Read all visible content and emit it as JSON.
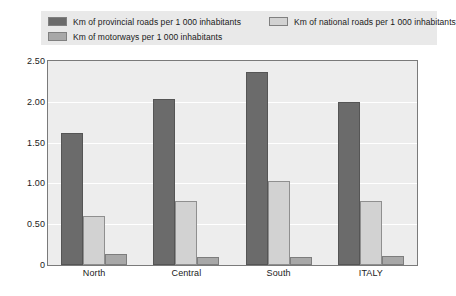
{
  "chart_data": {
    "type": "bar",
    "title": "",
    "xlabel": "",
    "ylabel": "",
    "categories": [
      "North",
      "Central",
      "South",
      "ITALY"
    ],
    "series": [
      {
        "name": "Km of provincial roads per 1 000 inhabitants",
        "color": "#6b6b6b",
        "values": [
          1.62,
          2.04,
          2.37,
          2.0
        ]
      },
      {
        "name": "Km of national roads per 1 000 inhabitants",
        "color": "#d2d2d2",
        "values": [
          0.6,
          0.79,
          1.03,
          0.79
        ]
      },
      {
        "name": "Km of motorways per 1 000 inhabitants",
        "color": "#a8a8a8",
        "values": [
          0.14,
          0.1,
          0.1,
          0.11
        ]
      }
    ],
    "ylim": [
      0,
      2.5
    ],
    "yticks": [
      0,
      0.5,
      1.0,
      1.5,
      2.0,
      2.5
    ],
    "ytick_labels": [
      "0",
      "0.50",
      "1.00",
      "1.50",
      "2.00",
      "2.50"
    ],
    "grid": true,
    "legend_position": "top"
  },
  "legend": {
    "items": [
      {
        "label": "Km of provincial roads per 1 000 inhabitants",
        "swatch": "provincial"
      },
      {
        "label": "Km of national roads per 1 000 inhabitants",
        "swatch": "national"
      },
      {
        "label": "Km of motorways per 1 000 inhabitants",
        "swatch": "motorway"
      }
    ]
  }
}
